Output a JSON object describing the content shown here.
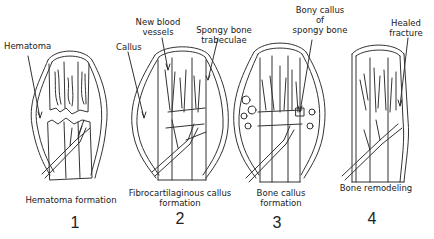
{
  "diagram": {
    "stages": [
      {
        "number": "1",
        "caption": "Hematoma formation",
        "caption_line2": ""
      },
      {
        "number": "2",
        "caption": "Fibrocartilaginous callus",
        "caption_line2": "formation"
      },
      {
        "number": "3",
        "caption": "Bone callus",
        "caption_line2": "formation"
      },
      {
        "number": "4",
        "caption": "Bone remodeling",
        "caption_line2": ""
      }
    ],
    "labels": {
      "hematoma": "Hematoma",
      "callus": "Callus",
      "new_blood_vessels_1": "New blood",
      "new_blood_vessels_2": "vessels",
      "spongy_trabeculae_1": "Spongy bone",
      "spongy_trabeculae_2": "trabeculae",
      "bony_callus_1": "Bony callus",
      "bony_callus_2": "of",
      "bony_callus_3": "spongy bone",
      "healed_fracture_1": "Healed",
      "healed_fracture_2": "fracture"
    },
    "colors": {
      "line": "#333333",
      "background": "#ffffff"
    }
  }
}
